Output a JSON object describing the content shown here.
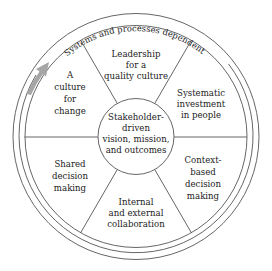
{
  "diagram": {
    "title_partial_cut": "",
    "outer_ring_label": "Systems and processes dependent",
    "center": {
      "lines": [
        "Stakeholder-",
        "driven",
        "vision, mission,",
        "and outcomes"
      ]
    },
    "sectors": [
      {
        "id": "leadership",
        "lines": [
          "Leadership",
          "for a",
          "quality culture"
        ]
      },
      {
        "id": "investment",
        "lines": [
          "Systematic",
          "investment",
          "in people"
        ]
      },
      {
        "id": "context",
        "lines": [
          "Context-",
          "based",
          "decision",
          "making"
        ]
      },
      {
        "id": "collaboration",
        "lines": [
          "Internal",
          "and external",
          "collaboration"
        ]
      },
      {
        "id": "shared",
        "lines": [
          "Shared",
          "decision",
          "making"
        ]
      },
      {
        "id": "change",
        "lines": [
          "A",
          "culture",
          "for",
          "change"
        ]
      }
    ],
    "colors": {
      "line": "#555555",
      "text": "#222222",
      "arrow": "#a6a6a6",
      "background": "#ffffff"
    },
    "icons": {
      "arrow": "gray-curved-arrow"
    }
  }
}
